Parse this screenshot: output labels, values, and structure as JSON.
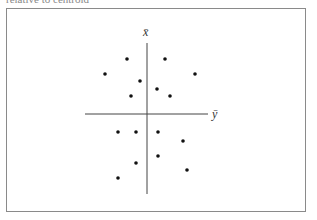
{
  "caption_partial": "relative to centroid",
  "diagram": {
    "axes": {
      "vertical_label": "x̄",
      "horizontal_label": "ȳ",
      "origin_px": [
        147,
        114
      ]
    },
    "colors": {
      "frame": "#8a8a8a",
      "axis": "#444444",
      "point": "#111111"
    }
  },
  "chart_data": {
    "type": "scatter",
    "title": "",
    "xlabel": "ȳ",
    "ylabel": "x̄",
    "grid": false,
    "points_px": [
      [
        127,
        59
      ],
      [
        165,
        59
      ],
      [
        105,
        74
      ],
      [
        195,
        74
      ],
      [
        140,
        81
      ],
      [
        157,
        89
      ],
      [
        131,
        96
      ],
      [
        170,
        96
      ],
      [
        118,
        132
      ],
      [
        136,
        132
      ],
      [
        158,
        132
      ],
      [
        183,
        141
      ],
      [
        158,
        156
      ],
      [
        136,
        163
      ],
      [
        187,
        170
      ],
      [
        118,
        178
      ]
    ],
    "points_relative_to_origin": [
      [
        -20,
        55
      ],
      [
        18,
        55
      ],
      [
        -42,
        40
      ],
      [
        48,
        40
      ],
      [
        -7,
        33
      ],
      [
        10,
        25
      ],
      [
        -16,
        18
      ],
      [
        23,
        18
      ],
      [
        -29,
        -18
      ],
      [
        -11,
        -18
      ],
      [
        11,
        -18
      ],
      [
        36,
        -27
      ],
      [
        11,
        -42
      ],
      [
        -11,
        -49
      ],
      [
        40,
        -56
      ],
      [
        -29,
        -64
      ]
    ]
  }
}
